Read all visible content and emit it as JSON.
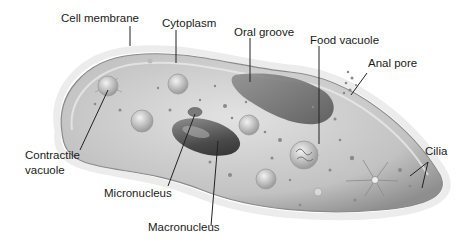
{
  "diagram": {
    "labels": {
      "cell_membrane": "Cell membrane",
      "cytoplasm": "Cytoplasm",
      "oral_groove": "Oral groove",
      "food_vacuole": "Food vacuole",
      "anal_pore": "Anal pore",
      "cilia": "Cilia",
      "contractile_vacuole_1": "Contractile",
      "contractile_vacuole_2": "vacuole",
      "micronucleus": "Micronucleus",
      "macronucleus": "Macronucleus"
    },
    "colors": {
      "body_fill": "#c4c4c4",
      "body_edge": "#8a8a8a",
      "groove": "#6e6e6e",
      "nucleus": "#5a5a5a",
      "leader_line": "#222222",
      "cilia": "#cfcfcf"
    }
  }
}
